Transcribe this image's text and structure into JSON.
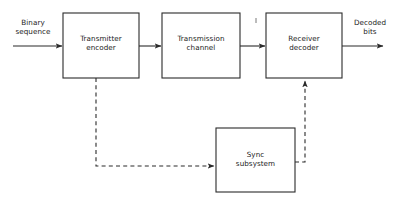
{
  "diagram": {
    "type": "block-diagram",
    "background_color": "#ffffff",
    "line_color": "#2b2b2b",
    "blocks": [
      {
        "id": "transmitter-encoder",
        "label": "Transmitter\nencoder",
        "x": 63,
        "y": 13,
        "width": 76,
        "height": 65
      },
      {
        "id": "transmission-channel",
        "label": "Transmission\nchannel",
        "x": 162,
        "y": 13,
        "width": 78,
        "height": 65
      },
      {
        "id": "receiver-decoder",
        "label": "Receiver\ndecoder",
        "x": 266,
        "y": 13,
        "width": 76,
        "height": 65
      },
      {
        "id": "sync-subsystem",
        "label": "Sync\nsubsystem",
        "x": 216,
        "y": 128,
        "width": 79,
        "height": 64
      }
    ],
    "io_labels": [
      {
        "id": "binary-sequence",
        "text": "Binary\nsequence",
        "x": 8,
        "y": 18,
        "width": 50
      },
      {
        "id": "decoded-bits",
        "text": "Decoded\nbits",
        "x": 348,
        "y": 18,
        "width": 44
      }
    ],
    "connections": [
      {
        "id": "input-to-encoder",
        "style": "solid",
        "arrow": true
      },
      {
        "id": "encoder-to-channel",
        "style": "solid",
        "arrow": true
      },
      {
        "id": "channel-to-decoder",
        "style": "solid",
        "arrow": true
      },
      {
        "id": "decoder-to-output",
        "style": "solid",
        "arrow": true
      },
      {
        "id": "encoder-to-sync",
        "style": "dashed",
        "arrow": true
      },
      {
        "id": "sync-to-decoder",
        "style": "dashed",
        "arrow": true
      }
    ]
  }
}
